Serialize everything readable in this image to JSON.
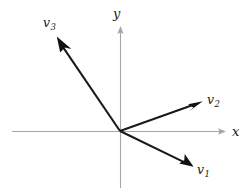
{
  "figure": {
    "background_color": "#ffffff",
    "width": 252,
    "height": 192
  },
  "axes": {
    "origin": {
      "x": 120,
      "y": 131
    },
    "color": "#a6a6a6",
    "x_axis": {
      "label": "x",
      "label_x": 232,
      "label_y": 125,
      "start_x": 12,
      "end_x": 226,
      "y": 131
    },
    "y_axis": {
      "label": "y",
      "label_x": 113,
      "label_y": 7,
      "start_y": 188,
      "end_y": 26,
      "x": 120
    }
  },
  "vectors": [
    {
      "name": "v1",
      "label": "v",
      "subscript": "1",
      "color": "#111111",
      "tail_x": 120,
      "tail_y": 131,
      "tip_x": 192,
      "tip_y": 166,
      "label_x": 197,
      "label_y": 164
    },
    {
      "name": "v2",
      "label": "v",
      "subscript": "2",
      "color": "#111111",
      "tail_x": 120,
      "tail_y": 131,
      "tip_x": 201,
      "tip_y": 102,
      "label_x": 207,
      "label_y": 94
    },
    {
      "name": "v3",
      "label": "v",
      "subscript": "3",
      "color": "#111111",
      "tail_x": 120,
      "tail_y": 131,
      "tip_x": 56,
      "tip_y": 37,
      "label_x": 43,
      "label_y": 17
    }
  ]
}
